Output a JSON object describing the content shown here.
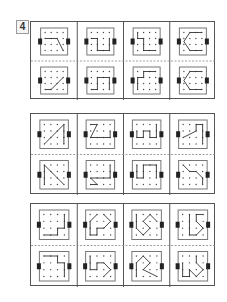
{
  "exercise": {
    "number_label": "4"
  },
  "layout": {
    "sections": [
      {
        "top": 21,
        "height": 78
      },
      {
        "top": 113,
        "height": 81
      },
      {
        "top": 203,
        "height": 83
      }
    ],
    "columns": 4,
    "col_width": 46.25,
    "colors": {
      "line": "#333333",
      "dot": "#444444",
      "frame": "#777777",
      "tab": "#222222",
      "divider": "#888888"
    }
  },
  "sections": [
    {
      "name": "section-1",
      "cells": [
        {
          "top": [
            [
              0,
              1
            ],
            [
              1,
              1
            ],
            [
              2,
              1
            ],
            [
              3,
              3
            ]
          ],
          "bottom": [
            [
              0,
              3
            ],
            [
              1,
              3
            ],
            [
              2,
              2
            ],
            [
              3,
              1
            ]
          ]
        },
        {
          "top": [
            [
              0,
              1
            ],
            [
              1,
              1
            ],
            [
              1,
              3
            ],
            [
              3,
              3
            ],
            [
              3,
              1
            ]
          ],
          "bottom": [
            [
              0,
              3
            ],
            [
              1,
              3
            ],
            [
              1,
              1
            ],
            [
              3,
              1
            ],
            [
              3,
              3
            ]
          ]
        },
        {
          "top": [
            [
              0,
              0
            ],
            [
              0,
              1
            ],
            [
              1,
              1
            ],
            [
              1,
              3
            ],
            [
              3,
              3
            ]
          ],
          "bottom": [
            [
              3,
              0
            ],
            [
              1,
              0
            ],
            [
              1,
              1
            ],
            [
              0,
              1
            ],
            [
              0,
              3
            ]
          ]
        },
        {
          "top": [
            [
              3,
              0
            ],
            [
              1,
              0
            ],
            [
              0,
              1.5
            ],
            [
              1,
              3
            ],
            [
              3,
              3
            ]
          ],
          "bottom": [
            [
              3,
              0
            ],
            [
              1,
              0
            ],
            [
              0,
              1.5
            ],
            [
              1,
              3
            ],
            [
              3,
              3
            ]
          ]
        }
      ]
    },
    {
      "name": "section-2",
      "cells": [
        {
          "top": [
            [
              0,
              3
            ],
            [
              3,
              0
            ],
            [
              3,
              3
            ]
          ],
          "bottom": [
            [
              0,
              3
            ],
            [
              0,
              0
            ],
            [
              3,
              3
            ]
          ]
        },
        {
          "top": [
            [
              0,
              0
            ],
            [
              1,
              0
            ],
            [
              0,
              2
            ],
            [
              3,
              2
            ],
            [
              3,
              1
            ]
          ],
          "bottom": [
            [
              3,
              0
            ],
            [
              3,
              2
            ],
            [
              0,
              2
            ],
            [
              1,
              3
            ],
            [
              0,
              3
            ]
          ]
        },
        {
          "top": [
            [
              0,
              1
            ],
            [
              0,
              2
            ],
            [
              1,
              2
            ],
            [
              1,
              1
            ],
            [
              2,
              1
            ],
            [
              2,
              2
            ],
            [
              3,
              2
            ],
            [
              3,
              0
            ]
          ],
          "bottom": [
            [
              0,
              0
            ],
            [
              0,
              2
            ],
            [
              1,
              2
            ],
            [
              1,
              0
            ],
            [
              3,
              0
            ],
            [
              3,
              2
            ]
          ]
        },
        {
          "top": [
            [
              0,
              2
            ],
            [
              2,
              1
            ],
            [
              2,
              0
            ],
            [
              3,
              0
            ],
            [
              3,
              3
            ]
          ],
          "bottom": [
            [
              0,
              0
            ],
            [
              1,
              1
            ],
            [
              2,
              1
            ],
            [
              3,
              2
            ],
            [
              3,
              3
            ]
          ]
        }
      ]
    },
    {
      "name": "section-3",
      "cells": [
        {
          "top": [
            [
              0,
              3
            ],
            [
              2,
              3
            ],
            [
              2,
              2
            ],
            [
              3,
              2
            ],
            [
              3,
              0
            ]
          ],
          "bottom": [
            [
              0,
              0
            ],
            [
              2,
              0
            ],
            [
              2,
              1
            ],
            [
              3,
              1
            ],
            [
              3,
              3
            ]
          ]
        },
        {
          "top": [
            [
              1,
              0
            ],
            [
              0,
              1
            ],
            [
              0,
              3
            ],
            [
              1,
              3
            ],
            [
              1,
              2
            ],
            [
              2,
              2
            ],
            [
              3,
              1
            ],
            [
              2,
              0
            ]
          ],
          "bottom": [
            [
              0,
              0
            ],
            [
              0,
              2
            ],
            [
              1,
              2
            ],
            [
              1,
              1
            ],
            [
              2,
              1
            ],
            [
              3,
              2
            ],
            [
              2,
              3
            ]
          ]
        },
        {
          "top": [
            [
              0,
              0
            ],
            [
              0,
              2
            ],
            [
              1,
              3
            ],
            [
              2,
              2
            ],
            [
              1,
              1
            ],
            [
              2,
              0
            ],
            [
              3,
              1
            ]
          ],
          "bottom": [
            [
              0,
              3
            ],
            [
              0,
              1
            ],
            [
              1,
              0
            ],
            [
              2,
              1
            ],
            [
              1,
              2
            ],
            [
              3,
              3
            ]
          ]
        },
        {
          "top": [
            [
              1,
              0
            ],
            [
              1,
              3
            ],
            [
              2,
              3
            ],
            [
              3,
              2
            ],
            [
              2,
              1
            ],
            [
              2,
              0
            ],
            [
              3,
              0
            ]
          ],
          "bottom": [
            [
              0,
              1
            ],
            [
              0,
              3
            ],
            [
              1,
              3
            ],
            [
              1,
              2
            ],
            [
              2,
              3
            ],
            [
              3,
              2
            ],
            [
              2,
              1
            ],
            [
              2,
              0
            ]
          ]
        }
      ]
    }
  ]
}
